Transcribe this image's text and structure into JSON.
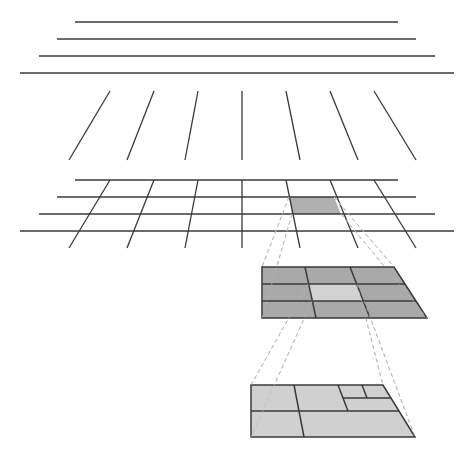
{
  "diagram": {
    "title": "",
    "colors": {
      "background": "#ffffff",
      "line": "#3a3a3a",
      "dashed": "#b8b8b8",
      "highlight_cell": "#b0b0b0",
      "zoom_grid_fill": "#a9a9a9",
      "zoom_center_fill": "#d2d2d2",
      "subdiv_fill": "#d0d0d0"
    },
    "horizontal_lines": [
      {
        "x1": 75,
        "x2": 398,
        "y": 22
      },
      {
        "x1": 57,
        "x2": 416,
        "y": 39
      },
      {
        "x1": 39,
        "x2": 435,
        "y": 56
      },
      {
        "x1": 20,
        "x2": 454,
        "y": 73
      }
    ],
    "slanted_lines": [
      {
        "x1": 110,
        "y1": 91,
        "x2": 69,
        "y2": 160
      },
      {
        "x1": 154,
        "y1": 91,
        "x2": 127,
        "y2": 160
      },
      {
        "x1": 198,
        "y1": 91,
        "x2": 185,
        "y2": 160
      },
      {
        "x1": 242,
        "y1": 91,
        "x2": 242,
        "y2": 160
      },
      {
        "x1": 286,
        "y1": 91,
        "x2": 300,
        "y2": 160
      },
      {
        "x1": 330,
        "y1": 91,
        "x2": 358,
        "y2": 160
      },
      {
        "x1": 374,
        "y1": 91,
        "x2": 416,
        "y2": 160
      }
    ],
    "combined_grid": {
      "rows_y": [
        180,
        197,
        214,
        231
      ],
      "rows_x1": [
        75,
        57,
        39,
        20
      ],
      "rows_x2": [
        398,
        416,
        435,
        454
      ],
      "verticals": [
        {
          "x1": 110,
          "y1": 180,
          "x2": 69,
          "y2": 248
        },
        {
          "x1": 154,
          "y1": 180,
          "x2": 127,
          "y2": 248
        },
        {
          "x1": 198,
          "y1": 180,
          "x2": 185,
          "y2": 248
        },
        {
          "x1": 242,
          "y1": 180,
          "x2": 242,
          "y2": 248
        },
        {
          "x1": 286,
          "y1": 180,
          "x2": 300,
          "y2": 248
        },
        {
          "x1": 330,
          "y1": 180,
          "x2": 358,
          "y2": 248
        },
        {
          "x1": 374,
          "y1": 180,
          "x2": 416,
          "y2": 248
        }
      ],
      "highlight_cell": {
        "points": "289,197 334,197 341,214 292,214"
      }
    },
    "zoom_grid_3x3": {
      "outline": "262,267 394,267 427,318 262,318",
      "h_dividers": [
        {
          "x1": 262,
          "y1": 284,
          "x2": 405,
          "y2": 284
        },
        {
          "x1": 262,
          "y1": 301,
          "x2": 416,
          "y2": 301
        }
      ],
      "v_dividers": [
        {
          "x1": 305,
          "y1": 267,
          "x2": 316,
          "y2": 318
        },
        {
          "x1": 350,
          "y1": 267,
          "x2": 370,
          "y2": 318
        }
      ],
      "center_cell": {
        "points": "308,284 357,284 364,301 312,301"
      }
    },
    "subdivided_grid": {
      "outline": "251,385 383,385 415,437 251,437",
      "lines": [
        {
          "x1": 251,
          "y1": 411,
          "x2": 399,
          "y2": 411
        },
        {
          "x1": 294,
          "y1": 385,
          "x2": 304,
          "y2": 437
        },
        {
          "x1": 338,
          "y1": 385,
          "x2": 348,
          "y2": 411
        },
        {
          "x1": 343,
          "y1": 398,
          "x2": 391,
          "y2": 398
        },
        {
          "x1": 362,
          "y1": 385,
          "x2": 367,
          "y2": 398
        }
      ]
    },
    "dashed_connectors": [
      {
        "x1": 289,
        "y1": 197,
        "x2": 262,
        "y2": 267
      },
      {
        "x1": 292,
        "y1": 214,
        "x2": 262,
        "y2": 318
      },
      {
        "x1": 334,
        "y1": 197,
        "x2": 394,
        "y2": 267
      },
      {
        "x1": 341,
        "y1": 214,
        "x2": 427,
        "y2": 318
      },
      {
        "x1": 308,
        "y1": 284,
        "x2": 251,
        "y2": 385
      },
      {
        "x1": 312,
        "y1": 301,
        "x2": 251,
        "y2": 437
      },
      {
        "x1": 357,
        "y1": 284,
        "x2": 383,
        "y2": 385
      },
      {
        "x1": 364,
        "y1": 301,
        "x2": 415,
        "y2": 437
      }
    ]
  }
}
